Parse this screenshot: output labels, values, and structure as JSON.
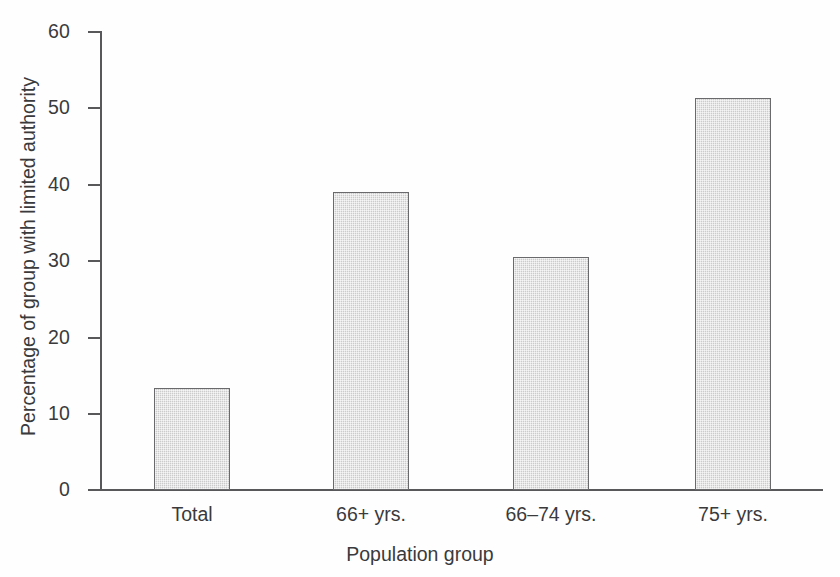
{
  "chart_data": {
    "type": "bar",
    "title": "",
    "subtitle": "",
    "xlabel": "Population group",
    "ylabel": "Percentage of group with limited authority",
    "categories": [
      "Total",
      "66+ yrs.",
      "66–74 yrs.",
      "75+ yrs."
    ],
    "values": [
      13.3,
      39.0,
      30.5,
      51.2
    ],
    "ylim": [
      0,
      60
    ],
    "yticks": [
      0,
      10,
      20,
      30,
      40,
      50,
      60
    ],
    "ytick_labels": [
      "0",
      "10",
      "20",
      "30",
      "40",
      "50",
      "60"
    ],
    "grid": false,
    "legend": false,
    "legend_position": "none",
    "bar_fill_color": "#cbcbcb",
    "bar_edge_color": "#6a6a6c",
    "axis_color": "#58585a",
    "text_color": "#3a3a3c",
    "background_color": "#ffffff"
  },
  "axes": {
    "y_title": "Percentage of group with limited authority",
    "x_title": "Population group"
  }
}
